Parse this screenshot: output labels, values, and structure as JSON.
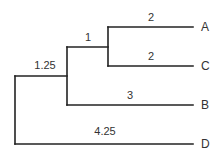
{
  "diagram": {
    "type": "phylogenetic-tree",
    "leaves": [
      {
        "id": "A",
        "label": "A"
      },
      {
        "id": "C",
        "label": "C"
      },
      {
        "id": "B",
        "label": "B"
      },
      {
        "id": "D",
        "label": "D"
      }
    ],
    "branch_lengths": {
      "root_to_ABC": "1.25",
      "ABC_to_AC": "1",
      "AC_to_A": "2",
      "AC_to_C": "2",
      "ABC_to_B": "3",
      "root_to_D": "4.25"
    },
    "newick": "(((A:2,C:2):1,B:3):1.25,D:4.25);",
    "colors": {
      "line": "#222222",
      "text": "#333333",
      "background": "#ffffff"
    }
  }
}
